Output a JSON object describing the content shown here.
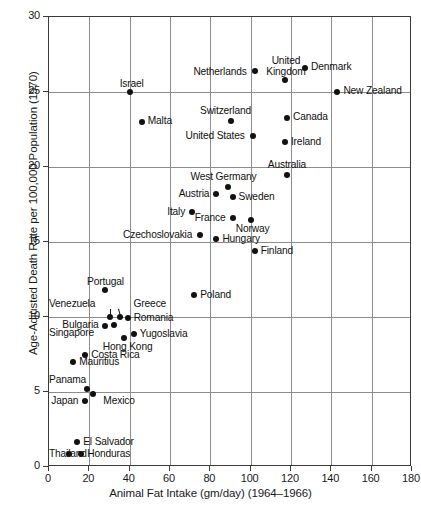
{
  "chart_data": {
    "type": "scatter",
    "title": "",
    "xlabel": "Animal Fat Intake (gm/day) (1964–1966)",
    "ylabel": "Age-Adjusted Death Rate per 100,000 Population (1970)",
    "xlim": [
      0,
      180
    ],
    "ylim": [
      0,
      30
    ],
    "xticks": [
      0,
      20,
      40,
      60,
      80,
      100,
      120,
      140,
      160,
      180
    ],
    "yticks": [
      0,
      5,
      10,
      15,
      20,
      25,
      30
    ],
    "grid": true,
    "legend": null,
    "points": [
      {
        "label": "Israel",
        "x": 40,
        "y": 25.0,
        "label_dx": 2,
        "label_dy": -13,
        "align": "center"
      },
      {
        "label": "Malta",
        "x": 46,
        "y": 23.0,
        "label_dx": 6,
        "label_dy": -6,
        "align": "left"
      },
      {
        "label": "Netherlands",
        "x": 102,
        "y": 26.4,
        "label_dx": -8,
        "label_dy": -4,
        "align": "right"
      },
      {
        "label": "United\nKingdom",
        "x": 117,
        "y": 25.8,
        "label_dx": 1,
        "label_dy": -24,
        "align": "center"
      },
      {
        "label": "Denmark",
        "x": 127,
        "y": 26.6,
        "label_dx": 6,
        "label_dy": -6,
        "align": "left"
      },
      {
        "label": "New Zealand",
        "x": 143,
        "y": 25.0,
        "label_dx": 6,
        "label_dy": -6,
        "align": "left"
      },
      {
        "label": "Switzerland",
        "x": 90,
        "y": 23.1,
        "label_dx": -5,
        "label_dy": -15,
        "align": "center"
      },
      {
        "label": "Canada",
        "x": 118,
        "y": 23.3,
        "label_dx": 6,
        "label_dy": -6,
        "align": "left"
      },
      {
        "label": "United States",
        "x": 101,
        "y": 22.1,
        "label_dx": -8,
        "label_dy": -5,
        "align": "right"
      },
      {
        "label": "Ireland",
        "x": 117,
        "y": 21.7,
        "label_dx": 6,
        "label_dy": -5,
        "align": "left"
      },
      {
        "label": "Australia",
        "x": 118,
        "y": 19.5,
        "label_dx": 0,
        "label_dy": -15,
        "align": "center"
      },
      {
        "label": "West Germany",
        "x": 89,
        "y": 18.7,
        "label_dx": -5,
        "label_dy": -15,
        "align": "center"
      },
      {
        "label": "Austria",
        "x": 83,
        "y": 18.2,
        "label_dx": -7,
        "label_dy": -5,
        "align": "right"
      },
      {
        "label": "Sweden",
        "x": 91,
        "y": 18.0,
        "label_dx": 6,
        "label_dy": -5,
        "align": "left"
      },
      {
        "label": "France",
        "x": 91,
        "y": 16.6,
        "label_dx": -7,
        "label_dy": -5,
        "align": "right"
      },
      {
        "label": "Norway",
        "x": 100,
        "y": 16.5,
        "label_dx": 2,
        "label_dy": 4,
        "align": "center"
      },
      {
        "label": "Italy",
        "x": 71,
        "y": 17.0,
        "label_dx": -7,
        "label_dy": -5,
        "align": "right"
      },
      {
        "label": "Czechoslovakia",
        "x": 75,
        "y": 15.5,
        "label_dx": -8,
        "label_dy": -5,
        "align": "right"
      },
      {
        "label": "Hungary",
        "x": 83,
        "y": 15.2,
        "label_dx": 6,
        "label_dy": -5,
        "align": "left"
      },
      {
        "label": "Finland",
        "x": 102,
        "y": 14.4,
        "label_dx": 6,
        "label_dy": -5,
        "align": "left"
      },
      {
        "label": "Poland",
        "x": 72,
        "y": 11.5,
        "label_dx": 6,
        "label_dy": -5,
        "align": "left"
      },
      {
        "label": "Portugal",
        "x": 28,
        "y": 11.8,
        "label_dx": 0,
        "label_dy": -13,
        "align": "center"
      },
      {
        "label": "Venezuela",
        "x": 30,
        "y": 10.0,
        "label_dx": -22,
        "label_dy": -18,
        "align": "right"
      },
      {
        "label": "Greece",
        "x": 35,
        "y": 10.0,
        "label_dx": 14,
        "label_dy": -18,
        "align": "left"
      },
      {
        "label": "Romania",
        "x": 39,
        "y": 9.95,
        "label_dx": 6,
        "label_dy": -5,
        "align": "left"
      },
      {
        "label": "Bulgaria",
        "x": 32,
        "y": 9.5,
        "label_dx": -15,
        "label_dy": -5,
        "align": "right"
      },
      {
        "label": "Singapore",
        "x": 28,
        "y": 9.4,
        "label_dx": -16,
        "label_dy": 2,
        "align": "right"
      },
      {
        "label": "Yugoslavia",
        "x": 42,
        "y": 8.9,
        "label_dx": 6,
        "label_dy": -5,
        "align": "left"
      },
      {
        "label": "Hong Kong",
        "x": 37,
        "y": 8.6,
        "label_dx": 4,
        "label_dy": 4,
        "align": "center"
      },
      {
        "label": "Costa Rica",
        "x": 18,
        "y": 7.5,
        "label_dx": 6,
        "label_dy": -5,
        "align": "left"
      },
      {
        "label": "Mauritius",
        "x": 12,
        "y": 7.0,
        "label_dx": 6,
        "label_dy": -5,
        "align": "left"
      },
      {
        "label": "Panama",
        "x": 19,
        "y": 5.2,
        "label_dx": -7,
        "label_dy": -14,
        "align": "right"
      },
      {
        "label": "Mexico",
        "x": 22,
        "y": 4.9,
        "label_dx": 10,
        "label_dy": 2,
        "align": "left"
      },
      {
        "label": "Japan",
        "x": 18,
        "y": 4.4,
        "label_dx": -7,
        "label_dy": -5,
        "align": "right"
      },
      {
        "label": "El Salvador",
        "x": 14,
        "y": 1.7,
        "label_dx": 6,
        "label_dy": -5,
        "align": "left"
      },
      {
        "label": "Thailand",
        "x": 10,
        "y": 0.9,
        "label_dx": -7,
        "label_dy": -5,
        "align": "right"
      },
      {
        "label": "Honduras",
        "x": 16,
        "y": 0.9,
        "label_dx": 6,
        "label_dy": -5,
        "align": "left"
      }
    ],
    "leaders": [
      {
        "x1": 30,
        "y1": 10.55,
        "x2": 30,
        "y2": 10.15
      },
      {
        "x1": 34.2,
        "y1": 10.55,
        "x2": 35,
        "y2": 10.15
      }
    ]
  },
  "caption": {
    "text": ""
  }
}
